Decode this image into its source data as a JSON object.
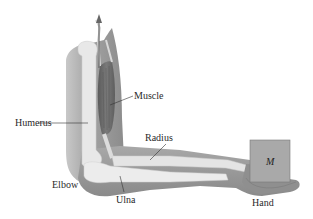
{
  "diagram": {
    "labels": {
      "muscle": "Muscle",
      "humerus": "Humerus",
      "radius": "Radius",
      "elbow": "Elbow",
      "ulna": "Ulna",
      "hand": "Hand",
      "mass": "M"
    },
    "icons": {
      "force_arrow": "upward-arrow"
    },
    "colors": {
      "skin": "#9a9a9a",
      "skin_light": "#b8b8b8",
      "bone": "#e6e6e6",
      "muscle": "#6e6e6e",
      "mass_box": "#a9a9a9",
      "leader_line": "#333333",
      "text": "#2a2a2a"
    }
  }
}
